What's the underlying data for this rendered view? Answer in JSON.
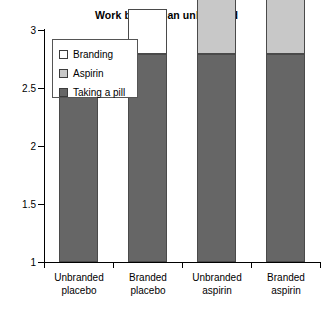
{
  "chart_data": {
    "type": "bar",
    "stacked": true,
    "title": "Work better than unbranded",
    "xlabel": "",
    "ylabel": "",
    "ylim": [
      1,
      3
    ],
    "yticks": [
      "1",
      "1.5",
      "2",
      "2.5",
      "3"
    ],
    "ytick_values": [
      1,
      1.5,
      2,
      2.5,
      3
    ],
    "grid": false,
    "legend_position": "upper left",
    "categories": [
      "Unbranded placebo",
      "Branded placebo",
      "Unbranded aspirin",
      "Branded aspirin"
    ],
    "category_lines": [
      [
        "Unbranded",
        "placebo"
      ],
      [
        "Branded",
        "placebo"
      ],
      [
        "Unbranded",
        "aspirin"
      ],
      [
        "Branded",
        "aspirin"
      ]
    ],
    "series": [
      {
        "name": "Taking a pill",
        "color": "#666666",
        "values": [
          1.79,
          1.79,
          1.79,
          1.79
        ]
      },
      {
        "name": "Aspirin",
        "color": "#c8c8c8",
        "values": [
          0,
          0,
          0.68,
          0.69
        ]
      },
      {
        "name": "Branding",
        "color": "#ffffff",
        "values": [
          0,
          0.39,
          0,
          0.23
        ]
      }
    ],
    "totals": [
      1.79,
      2.18,
      2.47,
      2.72
    ]
  },
  "legend": {
    "items": [
      {
        "label": "Branding",
        "color": "#ffffff"
      },
      {
        "label": "Aspirin",
        "color": "#c8c8c8"
      },
      {
        "label": "Taking a pill",
        "color": "#666666"
      }
    ]
  }
}
